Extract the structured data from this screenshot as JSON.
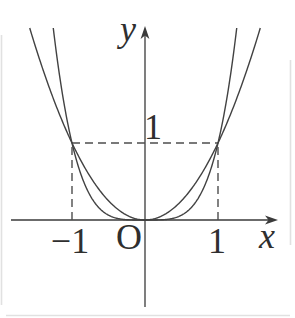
{
  "figure": {
    "labels": {
      "y_axis": "y",
      "x_axis": "x",
      "origin": "O",
      "y_tick_1": "1",
      "x_tick_neg_1": "−1",
      "x_tick_1": "1"
    },
    "colors": {
      "axis": "#3a3a3a",
      "curve": "#424242",
      "dash": "#4d4d4d",
      "edge_artifact": "#d9d9d9",
      "background": "#ffffff"
    }
  },
  "chart_data": {
    "type": "line",
    "title": "",
    "xlabel": "x",
    "ylabel": "y",
    "xlim": [
      -1.83,
      1.83
    ],
    "ylim": [
      -1.27,
      2.53
    ],
    "grid": false,
    "legend": "none",
    "series": [
      {
        "name": "y = x^2",
        "exponent": 2,
        "points_sample": [
          [
            -1.5,
            2.25
          ],
          [
            -1,
            1
          ],
          [
            -0.5,
            0.25
          ],
          [
            0,
            0
          ],
          [
            0.5,
            0.25
          ],
          [
            1,
            1
          ],
          [
            1.5,
            2.25
          ]
        ]
      },
      {
        "name": "y = x^4",
        "exponent": 4,
        "points_sample": [
          [
            -1.25,
            2.44
          ],
          [
            -1,
            1
          ],
          [
            -0.5,
            0.0625
          ],
          [
            0,
            0
          ],
          [
            0.5,
            0.0625
          ],
          [
            1,
            1
          ],
          [
            1.25,
            2.44
          ]
        ]
      }
    ],
    "intersections": [
      [
        -1,
        1
      ],
      [
        1,
        1
      ]
    ],
    "x_ticks": [
      -1,
      1
    ],
    "y_ticks": [
      1
    ],
    "guides": {
      "horizontal_dashed": {
        "y": 1,
        "x_from": -1,
        "x_to": 1
      },
      "vertical_dashed": [
        {
          "x": -1,
          "y_from": 0,
          "y_to": 1
        },
        {
          "x": 1,
          "y_from": 0,
          "y_to": 1
        }
      ]
    },
    "layout": {
      "origin_px": [
        145,
        220
      ],
      "unit_px": [
        73,
        77
      ],
      "curve_top_clip_px": 28,
      "y_axis_top_px": 26,
      "y_axis_bottom_px": 307,
      "x_axis_left_px": 11,
      "x_axis_right_px": 278,
      "dash_pattern": "8 5"
    }
  }
}
